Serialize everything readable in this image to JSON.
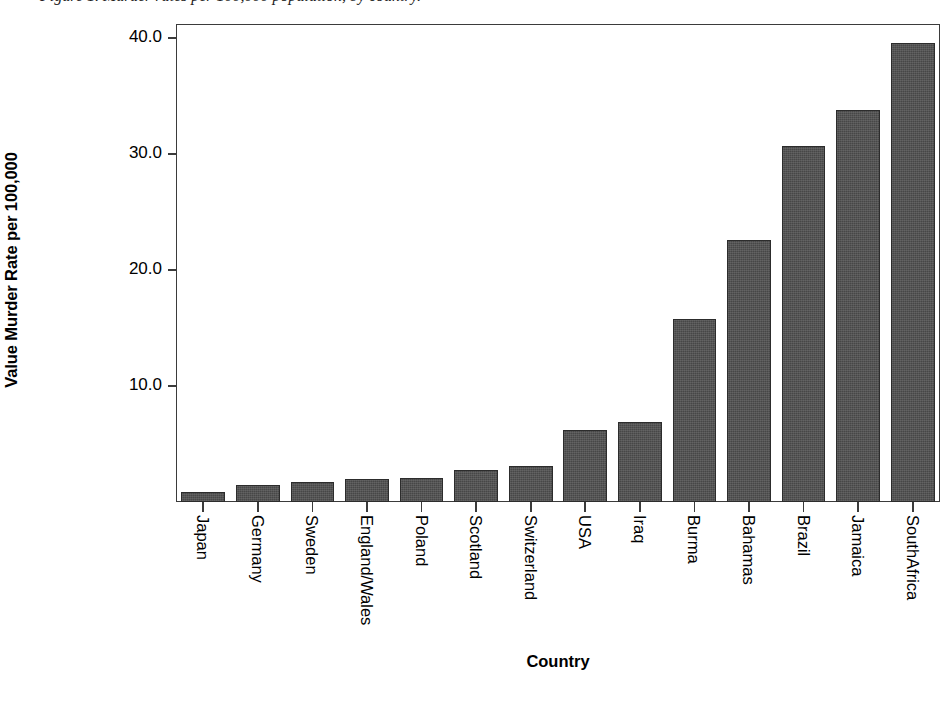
{
  "figure": {
    "caption_sliver": "Figure 1.  Murder rates per 100,000 population, by country.",
    "background_color": "#ffffff",
    "frame_color": "#3b3b3b",
    "bar_color": "#474747"
  },
  "chart_data": {
    "type": "bar",
    "title": "",
    "xlabel": "Country",
    "ylabel": "Value Murder Rate per 100,000",
    "categories": [
      "Japan",
      "Germany",
      "Sweden",
      "England/Wales",
      "Poland",
      "Scotland",
      "Switzerland",
      "USA",
      "Iraq",
      "Burma",
      "Bahamas",
      "Brazil",
      "Jamaica",
      "SouthAfrica"
    ],
    "values": [
      0.9,
      1.5,
      1.7,
      2.0,
      2.1,
      2.8,
      3.1,
      6.2,
      6.9,
      15.8,
      22.6,
      30.7,
      33.8,
      39.6
    ],
    "ylim": [
      0,
      41.2
    ],
    "ytick_values": [
      10.0,
      20.0,
      30.0,
      40.0
    ],
    "ytick_labels": [
      "10.0",
      "20.0",
      "30.0",
      "40.0"
    ],
    "grid": false,
    "legend": false,
    "orientation": "vertical",
    "xtick_label_rotation": -90
  }
}
